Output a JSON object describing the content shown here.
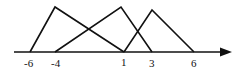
{
  "diagram": {
    "type": "fuzzy-triangular-membership",
    "axis": {
      "tick_labels": [
        "-6",
        "-4",
        "1",
        "3",
        "6"
      ],
      "arrow": true
    },
    "triangles": [
      {
        "name": "triangle-1",
        "left": "-6",
        "peak": "-4",
        "right": "1"
      },
      {
        "name": "triangle-2",
        "left": "-4",
        "peak": "1",
        "right": "3"
      },
      {
        "name": "triangle-3",
        "left": "1",
        "peak": "3",
        "right": "6"
      }
    ],
    "colors": {
      "stroke": "#111111",
      "background": "#ffffff"
    }
  }
}
